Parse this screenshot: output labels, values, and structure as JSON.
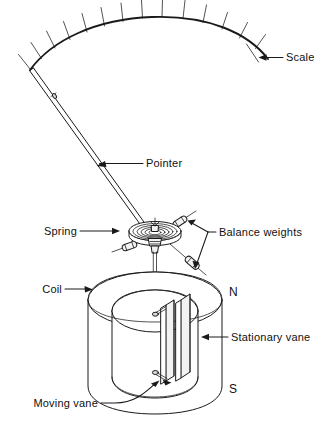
{
  "figure": {
    "background_color": "#ffffff",
    "ink_color": "#1a1a1a"
  },
  "labels": {
    "scale": "Scale",
    "pointer": "Pointer",
    "spring": "Spring",
    "balance_weights": "Balance weights",
    "coil": "Coil",
    "stationary_vane": "Stationary vane",
    "moving_vane": "Moving vane",
    "north_pole": "N",
    "south_pole": "S"
  },
  "scale_arc": {
    "tick_count": 13,
    "ticks_labeled": false
  },
  "parts": [
    {
      "name": "scale",
      "label": "Scale"
    },
    {
      "name": "pointer",
      "label": "Pointer"
    },
    {
      "name": "spring",
      "label": "Spring"
    },
    {
      "name": "balance-weights",
      "label": "Balance weights"
    },
    {
      "name": "coil",
      "label": "Coil"
    },
    {
      "name": "stationary-vane",
      "label": "Stationary vane"
    },
    {
      "name": "moving-vane",
      "label": "Moving vane"
    },
    {
      "name": "north-pole",
      "label": "N"
    },
    {
      "name": "south-pole",
      "label": "S"
    }
  ]
}
